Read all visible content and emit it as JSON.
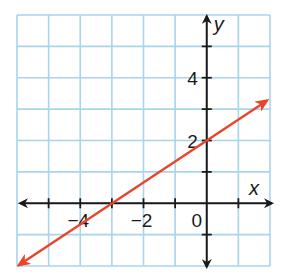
{
  "chart_data": {
    "type": "line",
    "title": "",
    "xlabel": "x",
    "ylabel": "y",
    "xlim": [
      -6,
      2
    ],
    "ylim": [
      -2,
      6
    ],
    "grid": true,
    "grid_step": 1,
    "x_tick_labels": [
      {
        "value": -4,
        "label": "−4"
      },
      {
        "value": -2,
        "label": "−2"
      },
      {
        "value": 0,
        "label": "0"
      }
    ],
    "y_tick_labels": [
      {
        "value": 2,
        "label": "2"
      },
      {
        "value": 4,
        "label": "4"
      }
    ],
    "series": [
      {
        "name": "line",
        "equation": "y = (2/3)x + 2",
        "slope": 0.6667,
        "y_intercept": 2,
        "x_intercept": -3,
        "points": [
          [
            -6,
            -2
          ],
          [
            -3,
            0
          ],
          [
            0,
            2
          ],
          [
            1.9,
            3.27
          ]
        ],
        "color": "#e8452a",
        "arrows": "both"
      }
    ],
    "legend": null
  },
  "colors": {
    "grid": "#a8d4ec",
    "axes": "#1a1a1a",
    "line": "#e8452a"
  }
}
